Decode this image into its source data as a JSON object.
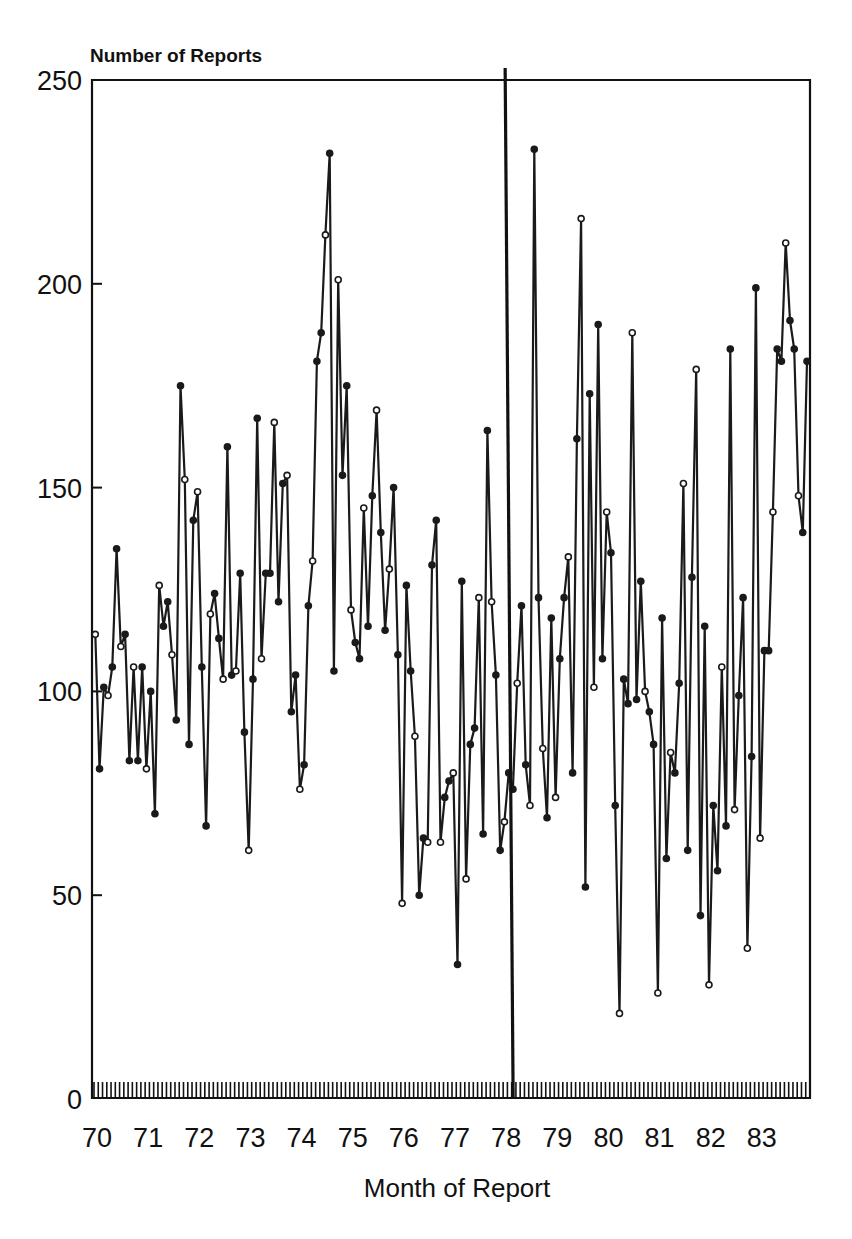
{
  "chart_data": {
    "type": "line",
    "title": "",
    "ylabel": "Number of Reports",
    "xlabel": "Month of Report",
    "ylim": [
      0,
      250
    ],
    "yticks": [
      0,
      50,
      100,
      150,
      200,
      250
    ],
    "xtick_labels": [
      "70",
      "71",
      "72",
      "73",
      "74",
      "75",
      "76",
      "77",
      "78",
      "79",
      "80",
      "81",
      "82",
      "83"
    ],
    "x_start_year": 1970,
    "x_end_year": 1983,
    "months": 168,
    "grid": false,
    "legend": null,
    "markers": "circle",
    "annotations": [
      {
        "type": "vertical_line",
        "x_label": "78",
        "description": "heavy vertical reference line at start of 1978"
      }
    ],
    "series": [
      {
        "name": "Number of Reports",
        "values": [
          114,
          81,
          101,
          99,
          106,
          135,
          111,
          114,
          83,
          106,
          83,
          106,
          81,
          100,
          70,
          126,
          116,
          122,
          109,
          93,
          175,
          152,
          87,
          142,
          149,
          106,
          67,
          119,
          124,
          113,
          103,
          160,
          104,
          105,
          129,
          90,
          61,
          103,
          167,
          108,
          129,
          129,
          166,
          122,
          151,
          153,
          95,
          104,
          76,
          82,
          121,
          132,
          181,
          188,
          212,
          232,
          105,
          201,
          153,
          175,
          120,
          112,
          108,
          145,
          116,
          148,
          169,
          139,
          115,
          130,
          150,
          109,
          48,
          126,
          105,
          89,
          50,
          64,
          63,
          131,
          142,
          63,
          74,
          78,
          80,
          33,
          127,
          54,
          87,
          91,
          123,
          65,
          164,
          122,
          104,
          61,
          68,
          80,
          76,
          102,
          121,
          82,
          72,
          233,
          123,
          86,
          69,
          118,
          74,
          108,
          123,
          133,
          80,
          162,
          216,
          52,
          173,
          101,
          190,
          108,
          144,
          134,
          72,
          21,
          103,
          97,
          188,
          98,
          127,
          100,
          95,
          87,
          26,
          118,
          59,
          85,
          80,
          102,
          151,
          61,
          128,
          179,
          45,
          116,
          28,
          72,
          56,
          106,
          67,
          184,
          71,
          99,
          123,
          37,
          84,
          199,
          64,
          110,
          110,
          144,
          184,
          181,
          210,
          191,
          184,
          148,
          139,
          181
        ]
      }
    ]
  }
}
